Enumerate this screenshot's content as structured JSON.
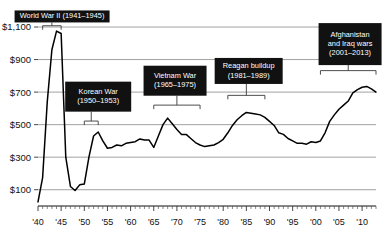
{
  "chart_data": {
    "type": "line",
    "title": "",
    "subtitle": "",
    "xlabel": "",
    "ylabel": "",
    "xlim": [
      1940,
      2013
    ],
    "ylim": [
      0,
      1180
    ],
    "grid": true,
    "legend_position": "none",
    "y_ticks": [
      100,
      300,
      500,
      700,
      900,
      1100
    ],
    "y_tick_labels": [
      "$100",
      "$300",
      "$500",
      "$700",
      "$900",
      "$1,100"
    ],
    "x_ticks": [
      1940,
      1945,
      1950,
      1955,
      1960,
      1965,
      1970,
      1975,
      1980,
      1985,
      1990,
      1995,
      2000,
      2005,
      2010
    ],
    "x_tick_labels": [
      "'40",
      "'45",
      "'50",
      "'55",
      "'60",
      "'65",
      "'70",
      "'75",
      "'80",
      "'85",
      "'90",
      "'95",
      "'00",
      "'05",
      "'10"
    ],
    "x": [
      1940,
      1941,
      1942,
      1943,
      1944,
      1945,
      1946,
      1947,
      1948,
      1949,
      1950,
      1951,
      1952,
      1953,
      1954,
      1955,
      1956,
      1957,
      1958,
      1959,
      1960,
      1961,
      1962,
      1963,
      1964,
      1965,
      1966,
      1967,
      1968,
      1969,
      1970,
      1971,
      1972,
      1973,
      1974,
      1975,
      1976,
      1977,
      1978,
      1979,
      1980,
      1981,
      1982,
      1983,
      1984,
      1985,
      1986,
      1987,
      1988,
      1989,
      1990,
      1991,
      1992,
      1993,
      1994,
      1995,
      1996,
      1997,
      1998,
      1999,
      2000,
      2001,
      2002,
      2003,
      2004,
      2005,
      2006,
      2007,
      2008,
      2009,
      2010,
      2011,
      2012,
      2013
    ],
    "values": [
      25,
      175,
      640,
      960,
      1075,
      1060,
      300,
      120,
      95,
      130,
      135,
      300,
      430,
      455,
      400,
      355,
      360,
      375,
      370,
      385,
      390,
      395,
      412,
      405,
      405,
      360,
      430,
      500,
      540,
      505,
      470,
      440,
      440,
      415,
      390,
      375,
      365,
      370,
      375,
      390,
      410,
      450,
      495,
      530,
      555,
      575,
      570,
      565,
      560,
      545,
      520,
      495,
      450,
      440,
      415,
      400,
      385,
      385,
      380,
      395,
      390,
      400,
      450,
      520,
      560,
      595,
      620,
      645,
      695,
      715,
      730,
      735,
      720,
      700
    ],
    "series": [
      {
        "name": "National defense outlays (billions of constant dollars)",
        "values": [
          25,
          175,
          640,
          960,
          1075,
          1060,
          300,
          120,
          95,
          130,
          135,
          300,
          430,
          455,
          400,
          355,
          360,
          375,
          370,
          385,
          390,
          395,
          412,
          405,
          405,
          360,
          430,
          500,
          540,
          505,
          470,
          440,
          440,
          415,
          390,
          375,
          365,
          370,
          375,
          390,
          410,
          450,
          495,
          530,
          555,
          575,
          570,
          565,
          560,
          545,
          520,
          495,
          450,
          440,
          415,
          400,
          385,
          385,
          380,
          395,
          390,
          400,
          450,
          520,
          560,
          595,
          620,
          645,
          695,
          715,
          730,
          735,
          720,
          700
        ]
      }
    ],
    "annotations": [
      {
        "id": "world-war-ii",
        "label_lines": [
          "World War II (1941–1945)"
        ],
        "span_start": 1941,
        "span_end": 1945,
        "box_center_year": 1945.2,
        "box_value": 1165,
        "box_w": 95,
        "box_h": 12,
        "bracket_value": 1108
      },
      {
        "id": "korean-war",
        "label_lines": [
          "Korean War",
          "(1950–1953)"
        ],
        "span_start": 1950,
        "span_end": 1953,
        "box_center_year": 1953.0,
        "box_value": 672,
        "box_w": 66,
        "box_h": 30,
        "bracket_value": 522
      },
      {
        "id": "vietnam-war",
        "label_lines": [
          "Vietnam War",
          "(1965–1975)"
        ],
        "span_start": 1965,
        "span_end": 1975,
        "box_center_year": 1969.6,
        "box_value": 770,
        "box_w": 63,
        "box_h": 30,
        "bracket_value": 620
      },
      {
        "id": "reagan-buildup",
        "label_lines": [
          "Reagan buildup",
          "(1981–1989)"
        ],
        "span_start": 1981,
        "span_end": 1989,
        "box_center_year": 1985.5,
        "box_value": 830,
        "box_w": 68,
        "box_h": 26,
        "bracket_value": 680
      },
      {
        "id": "afghanistan-iraq-wars",
        "label_lines": [
          "Afghanistan",
          "and Iraq wars",
          "(2001–2013)"
        ],
        "span_start": 2001,
        "span_end": 2013,
        "box_center_year": 2007.4,
        "box_value": 995,
        "box_w": 63,
        "box_h": 42,
        "bracket_value": 832
      }
    ]
  },
  "colors": {
    "line": "#000000",
    "grid": "#8a8a8a",
    "callout_bg": "#111111",
    "callout_text": "#ffffff",
    "axis": "#111111",
    "background": "#ffffff"
  }
}
